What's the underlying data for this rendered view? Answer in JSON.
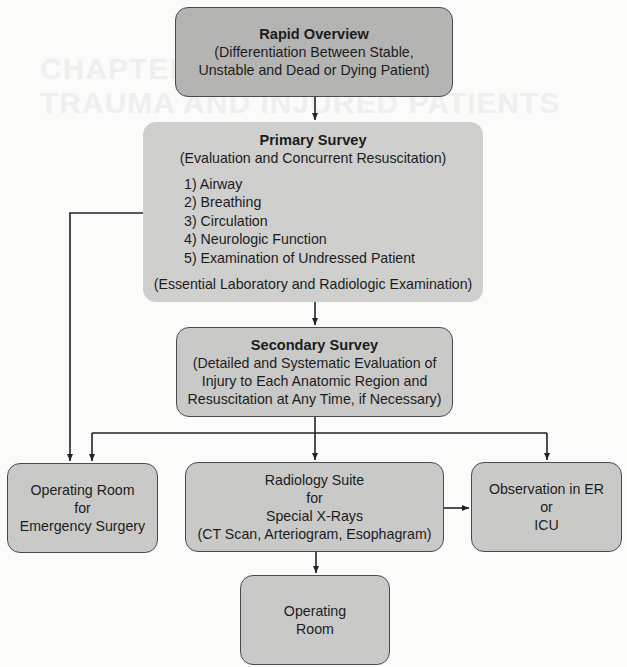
{
  "background_text": {
    "line1": "CHAPTER 3   CRITERIA FOR",
    "line2": "TRAUMA AND INJURED PATIENTS"
  },
  "nodes": {
    "rapid_overview": {
      "title": "Rapid Overview",
      "lines": [
        "(Differentiation Between Stable,",
        "Unstable and Dead or Dying Patient)"
      ]
    },
    "primary_survey": {
      "title": "Primary Survey",
      "subtitle": "(Evaluation and Concurrent Resuscitation)",
      "items": [
        "1) Airway",
        "2) Breathing",
        "3) Circulation",
        "4) Neurologic Function",
        "5) Examination of Undressed Patient"
      ],
      "footer": "(Essential Laboratory and Radiologic Examination)"
    },
    "secondary_survey": {
      "title": "Secondary Survey",
      "lines": [
        "(Detailed and Systematic Evaluation of",
        "Injury to Each Anatomic Region and",
        "Resuscitation at Any Time, if Necessary)"
      ]
    },
    "operating_room_emergency": {
      "lines": [
        "Operating Room",
        "for",
        "Emergency Surgery"
      ]
    },
    "radiology_suite": {
      "lines": [
        "Radiology Suite",
        "for",
        "Special X-Rays",
        "(CT Scan, Arteriogram, Esophagram)"
      ]
    },
    "observation": {
      "lines": [
        "Observation in ER",
        "or",
        "ICU"
      ]
    },
    "operating_room": {
      "lines": [
        "Operating",
        "Room"
      ]
    }
  },
  "edges": [
    {
      "from": "Rapid Overview",
      "to": "Primary Survey"
    },
    {
      "from": "Primary Survey",
      "to": "Secondary Survey"
    },
    {
      "from": "Primary Survey",
      "to": "Operating Room for Emergency Surgery"
    },
    {
      "from": "Secondary Survey",
      "to": "Operating Room for Emergency Surgery"
    },
    {
      "from": "Secondary Survey",
      "to": "Radiology Suite for Special X-Rays"
    },
    {
      "from": "Secondary Survey",
      "to": "Observation in ER or ICU"
    },
    {
      "from": "Radiology Suite for Special X-Rays",
      "to": "Observation in ER or ICU"
    },
    {
      "from": "Radiology Suite for Special X-Rays",
      "to": "Operating Room"
    }
  ]
}
